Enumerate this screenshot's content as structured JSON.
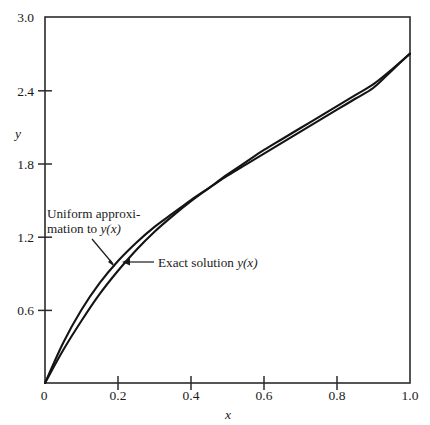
{
  "chart_data": {
    "type": "line",
    "title": "",
    "xlabel": "x",
    "ylabel": "y",
    "xlim": [
      0.0,
      1.0
    ],
    "ylim": [
      0.0,
      3.0
    ],
    "grid": false,
    "legend_position": "inline-annotations",
    "x_ticks": [
      {
        "value": 0.0,
        "label": "0"
      },
      {
        "value": 0.2,
        "label": "0.2"
      },
      {
        "value": 0.4,
        "label": "0.4"
      },
      {
        "value": 0.6,
        "label": "0.6"
      },
      {
        "value": 0.8,
        "label": "0.8"
      },
      {
        "value": 1.0,
        "label": "1.0"
      }
    ],
    "y_ticks": [
      {
        "value": 0.0,
        "label": "0"
      },
      {
        "value": 0.6,
        "label": "0.6"
      },
      {
        "value": 1.2,
        "label": "1.2"
      },
      {
        "value": 1.8,
        "label": "1.8"
      },
      {
        "value": 2.4,
        "label": "2.4"
      },
      {
        "value": 3.0,
        "label": "3.0"
      }
    ],
    "x": [
      0.0,
      0.05,
      0.1,
      0.15,
      0.2,
      0.25,
      0.3,
      0.35,
      0.4,
      0.45,
      0.5,
      0.55,
      0.6,
      0.65,
      0.7,
      0.75,
      0.8,
      0.85,
      0.9,
      0.95,
      1.0
    ],
    "series": [
      {
        "name": "Uniform approximation to y(x)",
        "values": [
          0.0,
          0.33,
          0.6,
          0.82,
          1.0,
          1.15,
          1.28,
          1.39,
          1.5,
          1.6,
          1.7,
          1.79,
          1.88,
          1.97,
          2.06,
          2.15,
          2.24,
          2.33,
          2.42,
          2.56,
          2.7
        ]
      },
      {
        "name": "Exact solution y(x)",
        "values": [
          0.0,
          0.27,
          0.51,
          0.73,
          0.92,
          1.09,
          1.24,
          1.37,
          1.49,
          1.6,
          1.71,
          1.81,
          1.91,
          2.0,
          2.09,
          2.18,
          2.27,
          2.36,
          2.45,
          2.57,
          2.7
        ]
      }
    ],
    "annotations": [
      {
        "id": "uniform-approximation-annotation",
        "line1": "Uniform approxi-",
        "line2_prefix": "mation to ",
        "line2_math": "y(x)",
        "points_to": "uniform-approximation-curve"
      },
      {
        "id": "exact-solution-annotation",
        "text_prefix": "Exact solution ",
        "text_math": "y(x)",
        "points_to": "exact-solution-curve"
      }
    ],
    "colors": {
      "curve": "#141414",
      "axis": "#2b2b2b",
      "background": "#ffffff"
    }
  }
}
